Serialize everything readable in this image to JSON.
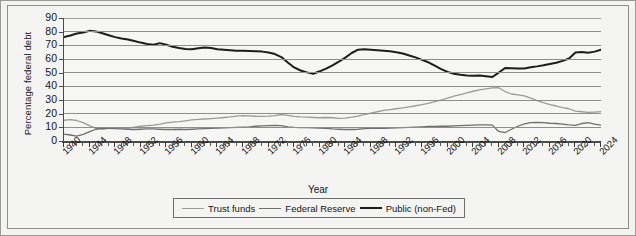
{
  "chart_data": {
    "type": "line",
    "title": "",
    "xlabel": "Year",
    "ylabel": "Percentage federal debt",
    "xlim": [
      1940,
      2024
    ],
    "ylim": [
      0,
      90
    ],
    "ytick_step": 10,
    "yticks": [
      "0",
      "10",
      "20",
      "30",
      "40",
      "50",
      "60",
      "70",
      "80",
      "90"
    ],
    "xticks": [
      "1940",
      "1944",
      "1948",
      "1952",
      "1956",
      "1960",
      "1964",
      "1968",
      "1972",
      "1976",
      "1980",
      "1984",
      "1988",
      "1992",
      "1996",
      "2000",
      "2004",
      "2008",
      "2012",
      "2016",
      "2020",
      "2024"
    ],
    "xtick_minor_step": 1,
    "grid": "horizontal",
    "legend_position": "bottom",
    "colors": {
      "trust_funds": "#9b9b9b",
      "federal_reserve": "#6f6f6f",
      "public_non_fed": "#1c1c1c",
      "gridline": "#8e8e8c",
      "axis": "#4a4a48",
      "plot_background": "#f6f6f4",
      "figure_background": "#f3f3f1"
    },
    "x": [
      1940,
      1941,
      1942,
      1943,
      1944,
      1945,
      1946,
      1947,
      1948,
      1949,
      1950,
      1951,
      1952,
      1953,
      1954,
      1955,
      1956,
      1957,
      1958,
      1959,
      1960,
      1961,
      1962,
      1963,
      1964,
      1965,
      1966,
      1967,
      1968,
      1969,
      1970,
      1971,
      1972,
      1973,
      1974,
      1975,
      1976,
      1977,
      1978,
      1979,
      1980,
      1981,
      1982,
      1983,
      1984,
      1985,
      1986,
      1987,
      1988,
      1989,
      1990,
      1991,
      1992,
      1993,
      1994,
      1995,
      1996,
      1997,
      1998,
      1999,
      2000,
      2001,
      2002,
      2003,
      2004,
      2005,
      2006,
      2007,
      2008,
      2009,
      2010,
      2011,
      2012,
      2013,
      2014,
      2015,
      2016,
      2017,
      2018,
      2019,
      2020,
      2021,
      2022,
      2023,
      2024
    ],
    "series": [
      {
        "name": "Trust funds",
        "color": "#9b9b9b",
        "values": [
          15.2,
          15.6,
          15.0,
          13.4,
          11.2,
          9.2,
          8.6,
          9.2,
          9.8,
          9.6,
          9.5,
          10.2,
          10.8,
          11.2,
          11.6,
          12.3,
          13.2,
          13.8,
          14.2,
          14.8,
          15.4,
          15.8,
          16.1,
          16.4,
          16.8,
          17.2,
          17.6,
          18.2,
          18.6,
          18.4,
          18.1,
          18.0,
          18.2,
          18.6,
          19.4,
          18.8,
          18.0,
          17.6,
          17.4,
          17.2,
          17.0,
          17.2,
          17.0,
          16.6,
          16.8,
          17.4,
          18.2,
          19.4,
          20.4,
          21.4,
          22.4,
          23.0,
          23.6,
          24.2,
          25.0,
          25.8,
          26.6,
          27.6,
          28.8,
          30.0,
          31.4,
          32.8,
          34.0,
          35.2,
          36.4,
          37.4,
          38.2,
          38.8,
          39.0,
          36.2,
          34.4,
          33.8,
          33.0,
          31.4,
          29.6,
          28.0,
          26.6,
          25.6,
          24.4,
          23.6,
          21.8,
          21.4,
          21.0,
          21.2,
          21.5
        ]
      },
      {
        "name": "Federal Reserve",
        "color": "#6f6f6f",
        "values": [
          5.0,
          4.4,
          3.6,
          4.8,
          6.8,
          8.6,
          9.4,
          9.2,
          9.0,
          8.8,
          8.6,
          8.4,
          8.6,
          8.8,
          8.8,
          8.6,
          8.4,
          8.4,
          8.6,
          8.4,
          8.6,
          8.8,
          9.0,
          9.2,
          9.4,
          9.6,
          9.8,
          10.0,
          10.2,
          10.4,
          10.8,
          11.0,
          11.2,
          11.4,
          11.2,
          10.4,
          10.0,
          9.8,
          9.8,
          9.6,
          9.4,
          9.2,
          8.8,
          8.6,
          8.4,
          8.4,
          8.6,
          9.0,
          9.2,
          9.2,
          9.2,
          9.4,
          9.6,
          9.8,
          10.0,
          10.2,
          10.4,
          10.6,
          10.6,
          10.8,
          10.8,
          11.0,
          11.2,
          11.4,
          11.6,
          11.8,
          11.8,
          11.6,
          7.0,
          6.2,
          8.6,
          10.8,
          12.6,
          13.4,
          13.6,
          13.4,
          13.0,
          12.8,
          12.4,
          11.8,
          11.4,
          12.8,
          13.4,
          12.4,
          11.6
        ]
      },
      {
        "name": "Public (non-Fed)",
        "color": "#1c1c1c",
        "values": [
          76.0,
          77.2,
          78.6,
          79.4,
          80.6,
          80.2,
          78.8,
          77.4,
          76.0,
          75.0,
          74.2,
          73.2,
          72.0,
          71.0,
          70.4,
          71.6,
          70.4,
          69.0,
          68.0,
          67.4,
          67.2,
          67.8,
          68.4,
          68.0,
          67.2,
          66.8,
          66.4,
          66.0,
          66.0,
          65.8,
          65.6,
          65.4,
          64.8,
          63.6,
          61.4,
          57.4,
          53.8,
          51.6,
          50.2,
          49.2,
          51.0,
          53.0,
          55.4,
          58.0,
          61.0,
          64.4,
          66.8,
          67.2,
          66.8,
          66.4,
          66.0,
          65.6,
          65.0,
          64.0,
          62.6,
          61.2,
          59.4,
          57.6,
          55.2,
          52.6,
          50.6,
          49.2,
          48.4,
          48.0,
          47.8,
          48.0,
          47.4,
          46.8,
          50.0,
          53.4,
          53.2,
          53.0,
          53.0,
          54.0,
          54.6,
          55.4,
          56.4,
          57.2,
          58.6,
          60.4,
          64.8,
          65.2,
          64.6,
          65.4,
          66.8
        ]
      }
    ]
  },
  "legend": {
    "items": [
      {
        "label": "Trust funds"
      },
      {
        "label": "Federal Reserve"
      },
      {
        "label": "Public (non-Fed)"
      }
    ]
  }
}
